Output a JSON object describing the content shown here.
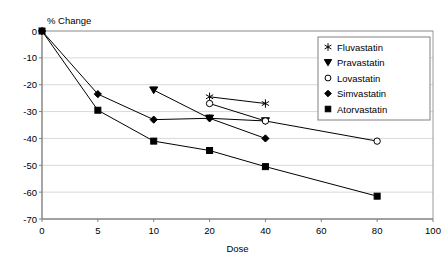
{
  "chart_data": {
    "type": "line",
    "title": "",
    "ylabel": "% Change",
    "xlabel": "Dose",
    "x_tick_labels": [
      "0",
      "5",
      "10",
      "20",
      "40",
      "60",
      "80",
      "100"
    ],
    "y_tick_labels": [
      "0",
      "-10",
      "-20",
      "-30",
      "-40",
      "-50",
      "-60",
      "-70"
    ],
    "ylim": [
      -70,
      0
    ],
    "grid": "horizontal",
    "legend_position": "top-right",
    "axis_type": "categorical-x",
    "series": [
      {
        "name": "Fluvastatin",
        "marker": "star",
        "points": [
          {
            "x": "20",
            "y": -24.5
          },
          {
            "x": "40",
            "y": -27.0
          }
        ]
      },
      {
        "name": "Pravastatin",
        "marker": "triangle-down",
        "points": [
          {
            "x": "10",
            "y": -22.0
          },
          {
            "x": "20",
            "y": -32.5
          },
          {
            "x": "40",
            "y": -33.5
          }
        ]
      },
      {
        "name": "Lovastatin",
        "marker": "open-circle",
        "points": [
          {
            "x": "20",
            "y": -27.0
          },
          {
            "x": "40",
            "y": -33.5
          },
          {
            "x": "80",
            "y": -41.0
          }
        ]
      },
      {
        "name": "Simvastatin",
        "marker": "diamond",
        "points": [
          {
            "x": "0",
            "y": 0.0
          },
          {
            "x": "5",
            "y": -23.5
          },
          {
            "x": "10",
            "y": -33.0
          },
          {
            "x": "20",
            "y": -32.5
          },
          {
            "x": "40",
            "y": -40.0
          }
        ]
      },
      {
        "name": "Atorvastatin",
        "marker": "square",
        "points": [
          {
            "x": "0",
            "y": 0.0
          },
          {
            "x": "5",
            "y": -29.5
          },
          {
            "x": "10",
            "y": -41.0
          },
          {
            "x": "20",
            "y": -44.5
          },
          {
            "x": "40",
            "y": -50.5
          },
          {
            "x": "80",
            "y": -61.5
          }
        ]
      }
    ],
    "legend_entries": [
      {
        "label": "Fluvastatin",
        "marker": "star"
      },
      {
        "label": "Pravastatin",
        "marker": "triangle-down"
      },
      {
        "label": "Lovastatin",
        "marker": "open-circle"
      },
      {
        "label": "Simvastatin",
        "marker": "diamond"
      },
      {
        "label": "Atorvastatin",
        "marker": "square"
      }
    ],
    "colors": {
      "line": "#000000",
      "grid": "#d9d9d9",
      "axis": "#808080",
      "background": "#ffffff"
    }
  }
}
